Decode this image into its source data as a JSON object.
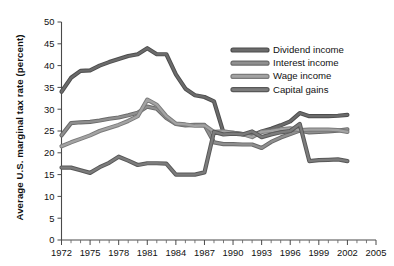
{
  "chart_data": {
    "type": "line",
    "title": "",
    "xlabel": "",
    "ylabel": "Average U.S. marginal tax rate (percent)",
    "xlim": [
      1972,
      2005
    ],
    "ylim": [
      0,
      50
    ],
    "yticks": [
      0,
      5,
      10,
      15,
      20,
      25,
      30,
      35,
      40,
      45,
      50
    ],
    "xticks": [
      1972,
      1975,
      1978,
      1981,
      1984,
      1987,
      1990,
      1993,
      1996,
      1999,
      2002,
      2005
    ],
    "xtick_labels": [
      "1972",
      "1975",
      "1978",
      "1981",
      "1984",
      "1987",
      "1990",
      "1993",
      "1996",
      "1999",
      "2002",
      "2005"
    ],
    "ytick_labels": [
      "0",
      "5",
      "10",
      "15",
      "20",
      "25",
      "30",
      "35",
      "40",
      "45",
      "50"
    ],
    "minor_tick_step": 1,
    "grid": false,
    "legend_position": "upper right",
    "x": [
      1972,
      1973,
      1974,
      1975,
      1976,
      1977,
      1978,
      1979,
      1980,
      1981,
      1982,
      1983,
      1984,
      1985,
      1986,
      1987,
      1988,
      1989,
      1990,
      1991,
      1992,
      1993,
      1994,
      1995,
      1996,
      1997,
      1998,
      1999,
      2000,
      2001,
      2002
    ],
    "series": [
      {
        "name": "Dividend income",
        "color": "#6b6b6b",
        "outline": "#4d4d4d",
        "values": [
          34.0,
          37.2,
          38.8,
          38.9,
          40.0,
          40.8,
          41.5,
          42.2,
          42.6,
          44.0,
          42.6,
          42.6,
          38.0,
          34.7,
          33.2,
          32.8,
          31.8,
          24.6,
          24.6,
          24.3,
          24.0,
          24.9,
          25.5,
          26.3,
          27.2,
          29.1,
          28.4,
          28.4,
          28.4,
          28.5,
          28.7
        ]
      },
      {
        "name": "Interest income",
        "color": "#8f8f8f",
        "outline": "#6a6a6a",
        "values": [
          24.0,
          26.8,
          27.0,
          27.1,
          27.4,
          27.8,
          28.1,
          28.6,
          29.2,
          30.6,
          30.1,
          28.0,
          26.6,
          26.3,
          26.4,
          26.4,
          22.4,
          22.0,
          22.0,
          21.9,
          21.9,
          21.1,
          22.5,
          23.5,
          24.3,
          25.1,
          24.7,
          24.8,
          24.9,
          25.1,
          25.4
        ]
      },
      {
        "name": "Wage income",
        "color": "#a3a3a3",
        "outline": "#7b7b7b",
        "values": [
          21.5,
          22.4,
          23.2,
          24.0,
          25.0,
          25.7,
          26.4,
          27.3,
          28.4,
          32.2,
          31.0,
          28.4,
          26.7,
          26.5,
          26.2,
          26.3,
          24.8,
          24.9,
          24.6,
          24.3,
          23.6,
          24.8,
          25.0,
          25.4,
          25.6,
          25.2,
          25.3,
          25.3,
          25.3,
          25.2,
          24.8
        ]
      },
      {
        "name": "Capital gains",
        "color": "#7c7c7c",
        "outline": "#585858",
        "values": [
          16.6,
          16.6,
          16.0,
          15.4,
          16.7,
          17.7,
          19.1,
          18.2,
          17.2,
          17.6,
          17.6,
          17.5,
          15.0,
          15.0,
          15.0,
          15.5,
          24.8,
          24.2,
          24.4,
          24.2,
          24.9,
          23.6,
          24.2,
          24.7,
          25.0,
          26.6,
          18.1,
          18.3,
          18.4,
          18.5,
          18.1
        ]
      }
    ]
  },
  "legend": {
    "items": [
      {
        "label": "Dividend income"
      },
      {
        "label": "Interest income"
      },
      {
        "label": "Wage income"
      },
      {
        "label": "Capital gains"
      }
    ]
  },
  "axis": {
    "y_title": "Average U.S. marginal tax rate (percent)"
  }
}
